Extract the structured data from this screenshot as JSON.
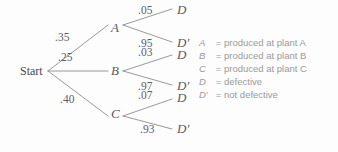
{
  "diagram": {
    "type": "probability-tree",
    "root": {
      "label": "Start",
      "x": 20,
      "y": 65
    },
    "nodes": [
      {
        "id": "A",
        "label": "A",
        "x": 111,
        "y": 21
      },
      {
        "id": "B",
        "label": "B",
        "x": 111,
        "y": 64
      },
      {
        "id": "C",
        "label": "C",
        "x": 111,
        "y": 107
      },
      {
        "id": "D_A",
        "label": "D",
        "x": 177,
        "y": 3
      },
      {
        "id": "Dp_A",
        "label": "D′",
        "x": 177,
        "y": 36
      },
      {
        "id": "D_B",
        "label": "D",
        "x": 177,
        "y": 48
      },
      {
        "id": "Dp_B",
        "label": "D′",
        "x": 177,
        "y": 79
      },
      {
        "id": "D_C",
        "label": "D",
        "x": 177,
        "y": 91
      },
      {
        "id": "Dp_C",
        "label": "D′",
        "x": 177,
        "y": 122
      }
    ],
    "edges": [
      {
        "from": "Start",
        "to": "A",
        "probability": ".35",
        "label_x": 55,
        "label_y": 32
      },
      {
        "from": "Start",
        "to": "B",
        "probability": ".25",
        "label_x": 58,
        "label_y": 52
      },
      {
        "from": "Start",
        "to": "C",
        "probability": ".40",
        "label_x": 60,
        "label_y": 94
      },
      {
        "from": "A",
        "to": "D",
        "probability": ".05",
        "label_x": 138,
        "label_y": 5
      },
      {
        "from": "A",
        "to": "D′",
        "probability": ".95",
        "label_x": 138,
        "label_y": 38
      },
      {
        "from": "B",
        "to": "D",
        "probability": ".03",
        "label_x": 138,
        "label_y": 47
      },
      {
        "from": "B",
        "to": "D′",
        "probability": ".97",
        "label_x": 138,
        "label_y": 81
      },
      {
        "from": "C",
        "to": "D",
        "probability": ".07",
        "label_x": 138,
        "label_y": 90
      },
      {
        "from": "C",
        "to": "D′",
        "probability": ".93",
        "label_x": 140,
        "label_y": 124
      }
    ]
  },
  "legend": {
    "rows": [
      {
        "symbol": "A",
        "equals": "=",
        "description": "produced at plant A"
      },
      {
        "symbol": "B",
        "equals": "=",
        "description": "produced at plant B"
      },
      {
        "symbol": "C",
        "equals": "=",
        "description": "produced at plant C"
      },
      {
        "symbol": "D",
        "equals": "=",
        "description": "defective"
      },
      {
        "symbol": "D′",
        "equals": "=",
        "description": "not defective"
      }
    ]
  },
  "colors": {
    "background": "#fdfdfd",
    "line": "#8d8d8d",
    "node_text": "#5a5a5a",
    "prob_text": "#5e5e5e",
    "legend_text": "#9a9a9a"
  }
}
